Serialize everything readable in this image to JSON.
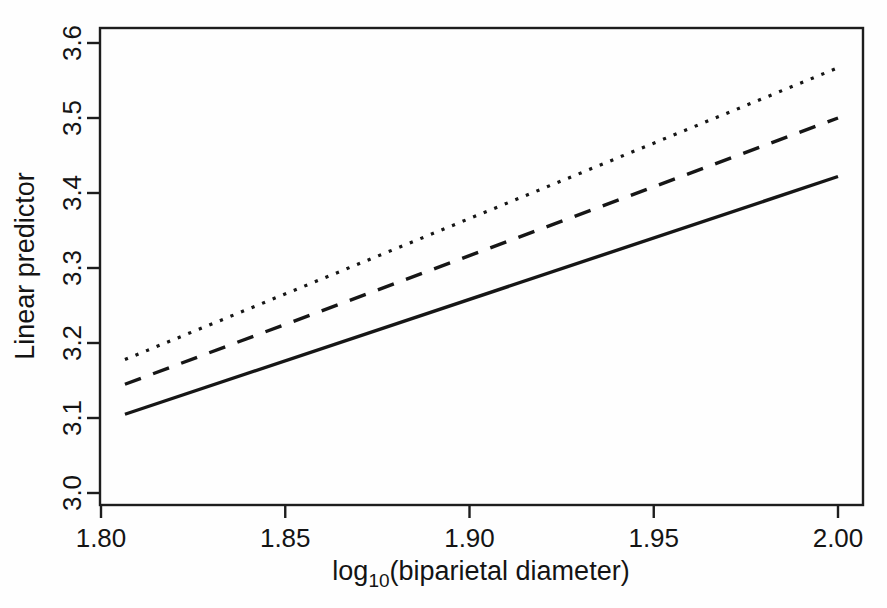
{
  "chart_data": {
    "type": "line",
    "title": "",
    "xlabel": "log10(biparietal diameter)",
    "xlabel_base": "log",
    "xlabel_subscript": "10",
    "xlabel_rest": "(biparietal diameter)",
    "ylabel": "Linear predictor",
    "xlim": [
      1.785,
      1.991
    ],
    "ylim": [
      2.976,
      3.637
    ],
    "xticks": [
      1.8,
      1.85,
      1.9,
      1.95,
      2.0
    ],
    "xtick_labels": [
      "1.80",
      "1.85",
      "1.90",
      "1.95",
      "2.00"
    ],
    "yticks": [
      3.0,
      3.1,
      3.2,
      3.3,
      3.4,
      3.5,
      3.6
    ],
    "ytick_labels": [
      "3.0",
      "3.1",
      "3.2",
      "3.3",
      "3.4",
      "3.5",
      "3.6"
    ],
    "grid": false,
    "legend": "none",
    "frame": true,
    "series": [
      {
        "name": "solid-line",
        "linestyle": "solid",
        "color": "#161616",
        "x": [
          1.8065,
          2.0
        ],
        "values": [
          3.105,
          3.422
        ]
      },
      {
        "name": "dashed-line",
        "linestyle": "dashed",
        "color": "#161616",
        "x": [
          1.8065,
          2.0
        ],
        "values": [
          3.145,
          3.5
        ]
      },
      {
        "name": "dotted-line",
        "linestyle": "dotted",
        "color": "#161616",
        "x": [
          1.8065,
          2.0
        ],
        "values": [
          3.178,
          3.567
        ]
      }
    ]
  },
  "figure": {
    "background_color": "#fefefe",
    "axis_color": "#1d1d1d"
  }
}
